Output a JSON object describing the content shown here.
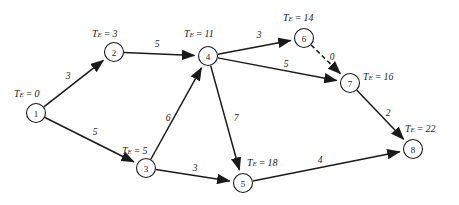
{
  "diagram": {
    "type": "pert-network-diagram",
    "title": "",
    "te_prefix": "T",
    "te_subscript": "E",
    "te_equals": " = ",
    "edge_style_solid": "solid",
    "edge_style_dashed": "dashed",
    "colors": {
      "stroke": "#1a1a1a",
      "node_fill": "#ffffff",
      "background": "#ffffff"
    }
  },
  "chart_data": {
    "type": "diagram",
    "nodes": [
      {
        "id": "1",
        "label": "1",
        "te_value": "0",
        "te_text": "T_E = 0",
        "x": 36,
        "y": 113,
        "r": 9.5,
        "te_x": 14,
        "te_y": 93,
        "te_anchor": "start"
      },
      {
        "id": "2",
        "label": "2",
        "te_value": "3",
        "te_text": "T_E = 3",
        "x": 114,
        "y": 52,
        "r": 9.5,
        "te_x": 92,
        "te_y": 33,
        "te_anchor": "start"
      },
      {
        "id": "3",
        "label": "3",
        "te_value": "5",
        "te_text": "T_E = 5",
        "x": 146,
        "y": 168,
        "r": 9.5,
        "te_x": 122,
        "te_y": 150,
        "te_anchor": "start"
      },
      {
        "id": "4",
        "label": "4",
        "te_value": "11",
        "te_text": "T_E = 11",
        "x": 208,
        "y": 56,
        "r": 9.5,
        "te_x": 184,
        "te_y": 33,
        "te_anchor": "start"
      },
      {
        "id": "5",
        "label": "5",
        "te_value": "18",
        "te_text": "T_E = 18",
        "x": 243,
        "y": 183,
        "r": 9.5,
        "te_x": 247,
        "te_y": 162,
        "te_anchor": "start"
      },
      {
        "id": "6",
        "label": "6",
        "te_value": "14",
        "te_text": "T_E = 14",
        "x": 304,
        "y": 38,
        "r": 9.5,
        "te_x": 283,
        "te_y": 17,
        "te_anchor": "start"
      },
      {
        "id": "7",
        "label": "7",
        "te_value": "16",
        "te_text": "T_E = 16",
        "x": 350,
        "y": 83,
        "r": 9.5,
        "te_x": 363,
        "te_y": 76,
        "te_anchor": "start"
      },
      {
        "id": "8",
        "label": "8",
        "te_value": "22",
        "te_text": "T_E = 22",
        "x": 413,
        "y": 149,
        "r": 9.5,
        "te_x": 405,
        "te_y": 128,
        "te_anchor": "start"
      }
    ],
    "edges": [
      {
        "id": "e1-2",
        "from": "1",
        "to": "2",
        "weight": "3",
        "style": "solid",
        "label_x": 68,
        "label_y": 76
      },
      {
        "id": "e1-3",
        "from": "1",
        "to": "3",
        "weight": "5",
        "style": "solid",
        "label_x": 95,
        "label_y": 132
      },
      {
        "id": "e2-4",
        "from": "2",
        "to": "4",
        "weight": "5",
        "style": "solid",
        "label_x": 157,
        "label_y": 44
      },
      {
        "id": "e3-4",
        "from": "3",
        "to": "4",
        "weight": "6",
        "style": "solid",
        "label_x": 168,
        "label_y": 118
      },
      {
        "id": "e3-5",
        "from": "3",
        "to": "5",
        "weight": "3",
        "style": "solid",
        "label_x": 195,
        "label_y": 168
      },
      {
        "id": "e4-5",
        "from": "4",
        "to": "5",
        "weight": "7",
        "style": "solid",
        "label_x": 236,
        "label_y": 118
      },
      {
        "id": "e4-6",
        "from": "4",
        "to": "6",
        "weight": "3",
        "style": "solid",
        "label_x": 259,
        "label_y": 35
      },
      {
        "id": "e4-7",
        "from": "4",
        "to": "7",
        "weight": "5",
        "style": "solid",
        "label_x": 286,
        "label_y": 64
      },
      {
        "id": "e6-7",
        "from": "6",
        "to": "7",
        "weight": "0",
        "style": "dashed",
        "label_x": 332,
        "label_y": 57
      },
      {
        "id": "e5-8",
        "from": "5",
        "to": "8",
        "weight": "4",
        "style": "solid",
        "label_x": 320,
        "label_y": 160
      },
      {
        "id": "e7-8",
        "from": "7",
        "to": "8",
        "weight": "2",
        "style": "solid",
        "label_x": 388,
        "label_y": 113
      }
    ],
    "xlabel": "",
    "ylabel": "",
    "legend": []
  }
}
